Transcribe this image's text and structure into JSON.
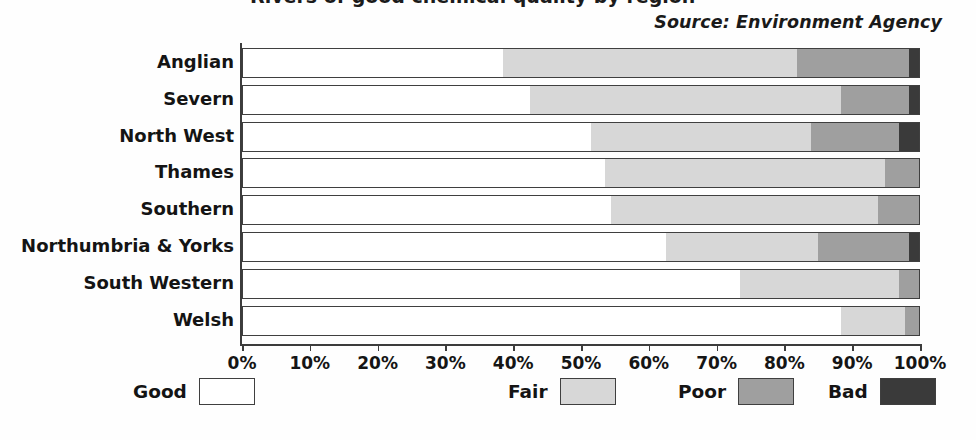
{
  "title_sliver": "Rivers of good chemical quality by region",
  "source_note": "Source: Environment Agency",
  "legend": {
    "items": [
      {
        "label": "Good",
        "color": "#ffffff"
      },
      {
        "label": "Fair",
        "color": "#d7d7d7"
      },
      {
        "label": "Poor",
        "color": "#9f9f9f"
      },
      {
        "label": "Bad",
        "color": "#3a3a3a"
      }
    ]
  },
  "chart_data": {
    "type": "bar",
    "orientation": "horizontal",
    "stacked": true,
    "normalized_percent": true,
    "title": "Rivers of good chemical quality by region",
    "subtitle": "",
    "xlabel": "",
    "ylabel": "",
    "xlim": [
      0,
      100
    ],
    "xticks": [
      0,
      10,
      20,
      30,
      40,
      50,
      60,
      70,
      80,
      90,
      100
    ],
    "xtick_labels": [
      "0%",
      "10%",
      "20%",
      "30%",
      "40%",
      "50%",
      "60%",
      "70%",
      "80%",
      "90%",
      "100%"
    ],
    "grid": false,
    "legend_position": "bottom",
    "annotations": [
      "Source: Environment Agency"
    ],
    "categories": [
      "Anglian",
      "Severn",
      "North West",
      "Thames",
      "Southern",
      "Northumbria & Yorks",
      "South Western",
      "Welsh"
    ],
    "series": [
      {
        "name": "Good",
        "color": "#ffffff",
        "values": [
          38.5,
          42.5,
          51.5,
          53.5,
          54.5,
          62.5,
          73.5,
          88.5
        ]
      },
      {
        "name": "Fair",
        "color": "#d7d7d7",
        "values": [
          43.5,
          46.0,
          32.5,
          41.5,
          39.5,
          22.5,
          23.5,
          9.5
        ]
      },
      {
        "name": "Poor",
        "color": "#9f9f9f",
        "values": [
          16.5,
          10.0,
          13.0,
          5.0,
          6.0,
          13.5,
          3.0,
          2.0
        ]
      },
      {
        "name": "Bad",
        "color": "#3a3a3a",
        "values": [
          1.5,
          1.5,
          3.0,
          0.0,
          0.0,
          1.5,
          0.0,
          0.0
        ]
      }
    ]
  }
}
